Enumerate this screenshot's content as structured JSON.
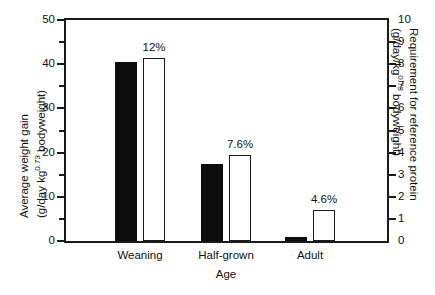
{
  "chart_data": {
    "type": "bar",
    "title": "",
    "xlabel": "Age",
    "categories": [
      "Weaning",
      "Half-grown",
      "Adult"
    ],
    "series": [
      {
        "name": "Average weight gain",
        "axis": "left",
        "style": "filled-black",
        "values": [
          40.4,
          17.4,
          0.9
        ]
      },
      {
        "name": "Requirement for reference protein",
        "axis": "right",
        "style": "open-white",
        "values": [
          8.3,
          3.9,
          1.4
        ],
        "labels": [
          "12%",
          "7.6%",
          "4.6%"
        ]
      }
    ],
    "left_axis": {
      "label_line1": "Average weight gain",
      "label_line2_pre": "(g/day kg",
      "label_line2_sup": "0.73",
      "label_line2_post": " bodyweight)",
      "ylim": [
        0,
        50
      ],
      "major_ticks": [
        0,
        10,
        20,
        30,
        40,
        50
      ],
      "minor_ticks": [
        5,
        15,
        25,
        35,
        45
      ],
      "tick_labels": [
        "0",
        "10",
        "20",
        "30",
        "40",
        "50"
      ]
    },
    "right_axis": {
      "label_line1": "Requirement for reference protein",
      "label_line2_pre": "(g/day/kg",
      "label_line2_sup": "0.73",
      "label_line2_post": " bodyweight)",
      "ylim": [
        0,
        10
      ],
      "major_ticks": [
        0,
        1,
        2,
        3,
        4,
        5,
        6,
        7,
        8,
        9,
        10
      ],
      "tick_labels": [
        "0",
        "1",
        "2",
        "3",
        "4",
        "5",
        "6",
        "7",
        "8",
        "9",
        "10"
      ]
    },
    "grid": false,
    "legend": "none",
    "colors": {
      "bar_solid": "#0d0d0d",
      "bar_open_fill": "#ffffff",
      "bar_open_stroke": "#1a1a1a",
      "axis": "#1a1a1a",
      "text": "#111111",
      "background": "#ffffff"
    }
  }
}
